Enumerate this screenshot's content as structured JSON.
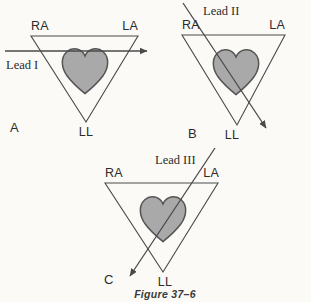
{
  "figure": {
    "caption": "Figure 37–6",
    "background_color": "#fbfaf7",
    "stroke_color": "#4a4a4a",
    "heart_fill_color": "#a9a9a9",
    "heart_stroke_color": "#555555",
    "text_color": "#2b2b2b"
  },
  "panels": [
    {
      "letter": "A",
      "lead_label": "Lead I",
      "vertices": {
        "right_arm": "RA",
        "left_arm": "LA",
        "left_leg": "LL"
      }
    },
    {
      "letter": "B",
      "lead_label": "Lead II",
      "vertices": {
        "right_arm": "RA",
        "left_arm": "LA",
        "left_leg": "LL"
      }
    },
    {
      "letter": "C",
      "lead_label": "Lead III",
      "vertices": {
        "right_arm": "RA",
        "left_arm": "LA",
        "left_leg": "LL"
      }
    }
  ]
}
